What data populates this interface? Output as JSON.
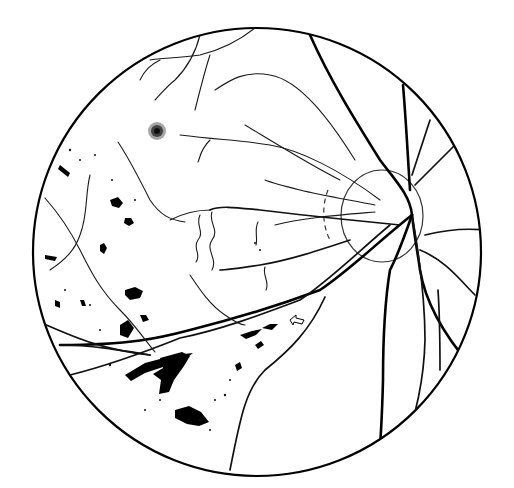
{
  "figure": {
    "type": "fundus-line-drawing",
    "colors": {
      "ink": "#000000",
      "background": "#ffffff"
    }
  },
  "annotations": {
    "arrow": {
      "label": "",
      "direction": "left-up",
      "position": [
        297,
        323
      ]
    }
  },
  "regions": {
    "optic_disc": {
      "center": [
        380,
        216
      ],
      "radius": 45
    },
    "field_of_view": {
      "center": [
        257,
        250
      ],
      "radius": 225
    },
    "macular_spot": {
      "center": [
        157,
        131
      ]
    }
  }
}
